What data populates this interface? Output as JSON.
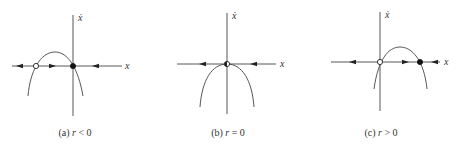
{
  "figure": {
    "stroke_color": "#444444",
    "panels": [
      {
        "id": "a",
        "caption_prefix": "(a)",
        "caption_var": "r",
        "caption_rel": "< 0",
        "caption_x": 75,
        "caption_y": 127,
        "axis_origin": [
          73,
          66
        ],
        "x_axis": [
          12,
          122
        ],
        "y_axis": [
          15,
          116
        ],
        "x_label": "x",
        "x_label_pos": [
          125,
          69
        ],
        "y_label": "ẋ",
        "y_label_pos": [
          78,
          21
        ],
        "curve": "M 28 96 Q 34 40 55 52 Q 76 60 83 96",
        "curve_path": "M 28 96 C 30 72, 40 52, 55 52 C 68 52, 78 68, 83 96",
        "fixed_points": [
          {
            "x": 36,
            "y": 66,
            "type": "open",
            "label": "unstable"
          },
          {
            "x": 73,
            "y": 66,
            "type": "filled",
            "label": "stable"
          }
        ],
        "arrows": [
          {
            "x": 20,
            "y": 66,
            "dir": "left"
          },
          {
            "x": 52,
            "y": 66,
            "dir": "right"
          },
          {
            "x": 96,
            "y": 66,
            "dir": "left"
          }
        ]
      },
      {
        "id": "b",
        "caption_prefix": "(b)",
        "caption_var": "r",
        "caption_rel": "= 0",
        "caption_x": 228,
        "caption_y": 127,
        "axis_origin": [
          227,
          64
        ],
        "x_axis": [
          177,
          276
        ],
        "y_axis": [
          13,
          114
        ],
        "x_label": "x",
        "x_label_pos": [
          280,
          67
        ],
        "y_label": "ẋ",
        "y_label_pos": [
          232,
          19
        ],
        "curve_path": "M 200 107 C 202 80, 212 64, 227 64 C 242 64, 252 80, 254 107",
        "fixed_points": [
          {
            "x": 227,
            "y": 64,
            "type": "half",
            "label": "half-stable"
          }
        ],
        "arrows": [
          {
            "x": 203,
            "y": 64,
            "dir": "left"
          },
          {
            "x": 254,
            "y": 64,
            "dir": "left"
          }
        ]
      },
      {
        "id": "c",
        "caption_prefix": "(c)",
        "caption_var": "r",
        "caption_rel": "> 0",
        "caption_x": 381,
        "caption_y": 127,
        "axis_origin": [
          380,
          62
        ],
        "x_axis": [
          331,
          440
        ],
        "y_axis": [
          12,
          111
        ],
        "x_label": "x",
        "x_label_pos": [
          444,
          65
        ],
        "y_label": "ẋ",
        "y_label_pos": [
          385,
          18
        ],
        "curve_path": "M 374 89 C 378 60, 388 47, 400 47 C 412 47, 424 60, 427 89",
        "fixed_points": [
          {
            "x": 380,
            "y": 62,
            "type": "open",
            "label": "unstable"
          },
          {
            "x": 420,
            "y": 62,
            "type": "filled",
            "label": "stable"
          }
        ],
        "arrows": [
          {
            "x": 353,
            "y": 62,
            "dir": "left"
          },
          {
            "x": 405,
            "y": 62,
            "dir": "right"
          },
          {
            "x": 435,
            "y": 62,
            "dir": "left"
          }
        ]
      }
    ]
  }
}
